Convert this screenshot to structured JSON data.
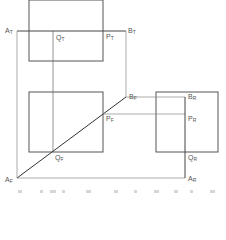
{
  "diagram": {
    "colors": {
      "stroke": "#444444",
      "thin_stroke": "#888888",
      "label": "#555555"
    },
    "views": [
      {
        "name": "top",
        "rect": {
          "x": 29,
          "y": 0,
          "w": 74,
          "h": 61
        }
      },
      {
        "name": "front",
        "rect": {
          "x": 29,
          "y": 92,
          "w": 74,
          "h": 60
        }
      },
      {
        "name": "right",
        "rect": {
          "x": 156,
          "y": 92,
          "w": 62,
          "h": 60
        }
      }
    ],
    "labels": {
      "AT": {
        "base": "A",
        "sub": "T"
      },
      "QT": {
        "base": "Q",
        "sub": "T"
      },
      "PT": {
        "base": "P",
        "sub": "T"
      },
      "BT": {
        "base": "B",
        "sub": "T"
      },
      "BF": {
        "base": "B",
        "sub": "F"
      },
      "PF": {
        "base": "P",
        "sub": "F"
      },
      "QF": {
        "base": "Q",
        "sub": "F"
      },
      "AF": {
        "base": "A",
        "sub": "F"
      },
      "BR": {
        "base": "B",
        "sub": "R"
      },
      "PR": {
        "base": "P",
        "sub": "R"
      },
      "QR": {
        "base": "Q",
        "sub": "R"
      },
      "AR": {
        "base": "A",
        "sub": "R"
      }
    }
  }
}
